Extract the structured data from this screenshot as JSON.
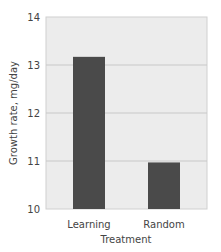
{
  "chart_data": {
    "type": "bar",
    "title": "",
    "xlabel": "Treatment",
    "ylabel": "Growth rate, mg/day",
    "categories": [
      "Learning",
      "Random"
    ],
    "values": [
      13.17,
      10.97
    ],
    "ylim": [
      10,
      14
    ],
    "yticks": [
      "10",
      "11",
      "12",
      "13",
      "14"
    ],
    "grid": true,
    "legend": null,
    "colors": {
      "bar": "#4a4a4a",
      "plot_background": "#ececec",
      "gridline": "#c8c8c8"
    }
  }
}
